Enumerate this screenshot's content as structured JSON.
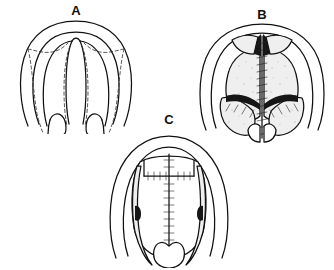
{
  "figure": {
    "kind": "medical-line-illustration",
    "background_color": "#ffffff",
    "ink_color": "#111111",
    "caption_fragment": ""
  },
  "panels": [
    {
      "id": "A",
      "label": "A",
      "title": "Cleft palate with planned incision lines",
      "description": "Oral view of hard and soft palate showing midline cleft; dashed lines mark planned mucoperiosteal flap incisions.",
      "features": [
        "palate-outline",
        "cleft-margin",
        "dashed-incision-lines",
        "uvula-halves"
      ]
    },
    {
      "id": "B",
      "label": "B",
      "title": "Flaps elevated and midline closure begun",
      "description": "Mucoperiosteal flaps raised with lateral relaxing incisions; midline suture ladder approximating the cleft edges.",
      "features": [
        "elevated-flaps",
        "lateral-relaxing-incision",
        "midline-suture-line",
        "exposed-bone"
      ]
    },
    {
      "id": "C",
      "label": "C",
      "title": "Completed repair",
      "description": "Midline and transverse suture lines completed; lateral relaxing incisions left open to granulate.",
      "features": [
        "midline-suture-line",
        "transverse-suture-line",
        "open-lateral-incisions",
        "repaired-uvula"
      ]
    }
  ]
}
